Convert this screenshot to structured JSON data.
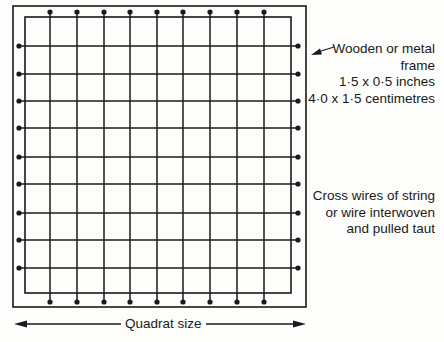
{
  "labels": {
    "frame": {
      "line1": "Wooden or metal",
      "line2": "frame",
      "line3": "1·5 x 0·5 inches",
      "line4": "4·0 x 1·5 centimetres"
    },
    "wires": {
      "line1": "Cross wires of string",
      "line2": "or wire interwoven",
      "line3": "and pulled taut"
    },
    "size": "Quadrat size"
  },
  "colors": {
    "ink": "#1a1a1a",
    "background": "#fdfdfb"
  },
  "geometry": {
    "outer_frame": {
      "x1": 13,
      "y1": 6,
      "x2": 306,
      "y2": 307
    },
    "inner_frame": {
      "x1": 25,
      "y1": 17,
      "x2": 291,
      "y2": 293
    },
    "vertical_wires_x": [
      50,
      77,
      104,
      130,
      157,
      183,
      210,
      237,
      264
    ],
    "horizontal_wires_y": [
      46,
      74,
      101,
      128,
      157,
      184,
      213,
      240,
      268
    ]
  }
}
